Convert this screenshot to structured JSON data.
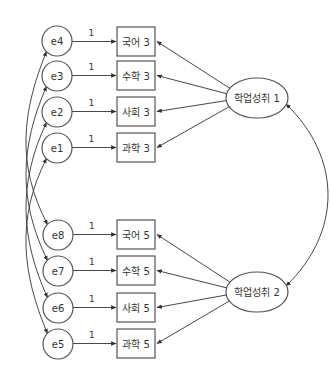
{
  "diagram": {
    "type": "structural-equation-model",
    "colors": {
      "stroke": "#555555",
      "text": "#333333",
      "background": "#ffffff"
    },
    "latent": [
      {
        "id": "L1",
        "label": "학업성취 1",
        "cx": 257,
        "cy": 98
      },
      {
        "id": "L2",
        "label": "학업성취 2",
        "cx": 257,
        "cy": 292
      }
    ],
    "observed": [
      {
        "id": "k3",
        "label": "국어 3",
        "y": 27,
        "latent": "L1",
        "error": "e4"
      },
      {
        "id": "m3",
        "label": "수학 3",
        "y": 61,
        "latent": "L1",
        "error": "e3"
      },
      {
        "id": "s3",
        "label": "사회 3",
        "y": 97,
        "latent": "L1",
        "error": "e2"
      },
      {
        "id": "c3",
        "label": "과학 3",
        "y": 133,
        "latent": "L1",
        "error": "e1"
      },
      {
        "id": "k5",
        "label": "국어 5",
        "y": 220,
        "latent": "L2",
        "error": "e8"
      },
      {
        "id": "m5",
        "label": "수학 5",
        "y": 256,
        "latent": "L2",
        "error": "e7"
      },
      {
        "id": "s5",
        "label": "사회 5",
        "y": 293,
        "latent": "L2",
        "error": "e6"
      },
      {
        "id": "c5",
        "label": "과학 5",
        "y": 329,
        "latent": "L2",
        "error": "e5"
      }
    ],
    "errors": [
      {
        "id": "e4",
        "label": "e4",
        "cx": 57,
        "cy": 41
      },
      {
        "id": "e3",
        "label": "e3",
        "cx": 57,
        "cy": 76
      },
      {
        "id": "e2",
        "label": "e2",
        "cx": 57,
        "cy": 112
      },
      {
        "id": "e1",
        "label": "e1",
        "cx": 57,
        "cy": 148
      },
      {
        "id": "e8",
        "label": "e8",
        "cx": 58,
        "cy": 235
      },
      {
        "id": "e7",
        "label": "e7",
        "cx": 58,
        "cy": 271
      },
      {
        "id": "e6",
        "label": "e6",
        "cx": 58,
        "cy": 308
      },
      {
        "id": "e5",
        "label": "e5",
        "cx": 58,
        "cy": 344
      }
    ],
    "error_path_label": "1",
    "covariances": [
      [
        "e4",
        "e8"
      ],
      [
        "e3",
        "e7"
      ],
      [
        "e2",
        "e6"
      ],
      [
        "e1",
        "e5"
      ],
      [
        "L1",
        "L2"
      ]
    ]
  }
}
